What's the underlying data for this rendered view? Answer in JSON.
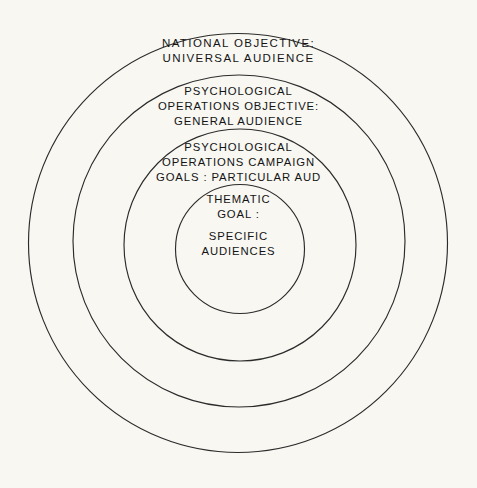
{
  "figure": {
    "type": "nested-circles-diagram",
    "background_color": "#f8f7f2",
    "line_color": "#2b2b2b",
    "text_color": "#141414"
  },
  "rings": [
    {
      "id": "national-objective",
      "level": 1,
      "position": "outermost",
      "center_x": 238,
      "center_y": 243,
      "radius": 210,
      "lines": [
        "NATIONAL   OBJECTIVE:",
        "UNIVERSAL        AUDIENCE"
      ],
      "title": "NATIONAL OBJECTIVE:",
      "audience": "UNIVERSAL AUDIENCE"
    },
    {
      "id": "psychological-operations-objective",
      "level": 2,
      "position": "second",
      "center_x": 239,
      "center_y": 241,
      "radius": 166,
      "lines": [
        "PSYCHOLOGICAL",
        "OPERATIONS  OBJECTIVE:",
        "GENERAL       AUDIENCE"
      ],
      "title": "PSYCHOLOGICAL OPERATIONS OBJECTIVE:",
      "audience": "GENERAL AUDIENCE"
    },
    {
      "id": "psychological-operations-campaign-goals",
      "level": 3,
      "position": "third",
      "center_x": 240,
      "center_y": 245,
      "radius": 116,
      "lines": [
        "PSYCHOLOGICAL",
        "OPERATIONS  CAMPAIGN",
        "GOALS :  PARTICULAR   AUD"
      ],
      "title": "PSYCHOLOGICAL OPERATIONS CAMPAIGN GOALS:",
      "audience": "PARTICULAR AUD"
    },
    {
      "id": "thematic-goal",
      "level": 4,
      "position": "innermost",
      "center_x": 240,
      "center_y": 249,
      "radius": 64,
      "lines": [
        "THEMATIC",
        "GOAL :",
        "SPECIFIC",
        "AUDIENCES"
      ],
      "title": "THEMATIC GOAL:",
      "audience": "SPECIFIC AUDIENCES"
    }
  ],
  "labels": {
    "national": {
      "line_1": "NATIONAL   OBJECTIVE:",
      "line_2": "UNIVERSAL        AUDIENCE"
    },
    "psyop_objective": {
      "line_1": "PSYCHOLOGICAL",
      "line_2": "OPERATIONS  OBJECTIVE:",
      "line_3": "GENERAL       AUDIENCE"
    },
    "psyop_campaign": {
      "line_1": "PSYCHOLOGICAL",
      "line_2": "OPERATIONS  CAMPAIGN",
      "line_3": "GOALS :  PARTICULAR   AUD"
    },
    "thematic": {
      "line_1": "THEMATIC",
      "line_2": "GOAL :",
      "line_3": "SPECIFIC",
      "line_4": "AUDIENCES"
    }
  }
}
